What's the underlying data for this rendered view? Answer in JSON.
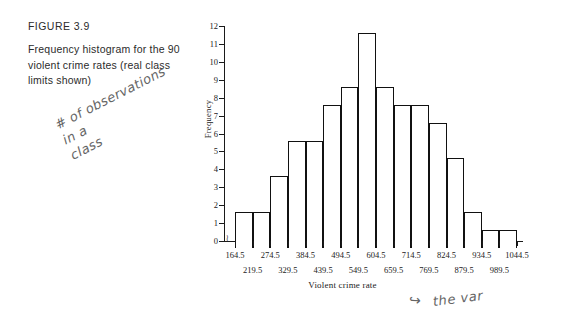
{
  "caption": {
    "figure_id": "FIGURE 3.9",
    "text": "Frequency histogram for the 90 violent crime rates (real class limits shown)"
  },
  "annotations": {
    "left_note": "# of observations\nin a\nclass",
    "right_note": "the var",
    "right_arrow": "↪"
  },
  "chart_data": {
    "type": "bar",
    "title": "",
    "xlabel": "Violent crime rate",
    "ylabel": "Frequency",
    "ylim": [
      0,
      12
    ],
    "ytick_labels": [
      "0",
      "1",
      "2",
      "3",
      "4",
      "5",
      "6",
      "7",
      "8",
      "9",
      "10",
      "11",
      "12"
    ],
    "grid": false,
    "legend": "none",
    "bin_width": 55,
    "boundaries": [
      164.5,
      219.5,
      274.5,
      329.5,
      384.5,
      439.5,
      494.5,
      549.5,
      604.5,
      659.5,
      714.5,
      769.5,
      824.5,
      879.5,
      934.5,
      989.5,
      1044.5
    ],
    "xtick_labels_row_upper": [
      "164.5",
      "274.5",
      "384.5",
      "494.5",
      "604.5",
      "714.5",
      "824.5",
      "934.5",
      "1044.5"
    ],
    "xtick_labels_row_lower": [
      "219.5",
      "329.5",
      "439.5",
      "549.5",
      "659.5",
      "769.5",
      "879.5",
      "989.5"
    ],
    "categories": [
      "164.5-219.5",
      "219.5-274.5",
      "274.5-329.5",
      "329.5-384.5",
      "384.5-439.5",
      "439.5-494.5",
      "494.5-549.5",
      "549.5-604.5",
      "604.5-659.5",
      "659.5-714.5",
      "714.5-769.5",
      "769.5-824.5",
      "824.5-879.5",
      "879.5-934.5",
      "934.5-989.5",
      "989.5-1044.5"
    ],
    "values": [
      2,
      2,
      4,
      6,
      6,
      8,
      9,
      12,
      9,
      8,
      8,
      7,
      5,
      2,
      1,
      1
    ],
    "total": 90,
    "axis_break_symbol": "≀"
  },
  "colors": {
    "ink": "#111111",
    "text": "#2b2b2b",
    "pencil": "#4a4a4a",
    "background": "#ffffff"
  }
}
